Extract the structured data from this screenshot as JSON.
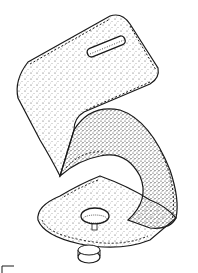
{
  "illustration": {
    "subject": "Z-shaped zigzag-stitched felt piece with slot and screw knob",
    "style": "black ink stipple line drawing on white",
    "colors": {
      "ink": "#1a1a1a",
      "background": "#ffffff"
    }
  }
}
